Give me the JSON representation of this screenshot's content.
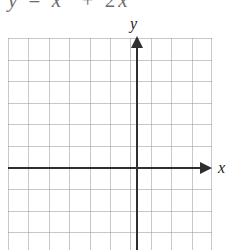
{
  "problem": {
    "equation_parts": {
      "lhs": "y",
      "equals": "=",
      "term1_base": "x",
      "term1_exp": "2",
      "plus": "+",
      "coefficient": "2",
      "term2": "x"
    },
    "equation_plain": "y = x2 + 2x"
  },
  "graph": {
    "x_axis_label": "x",
    "y_axis_label": "y",
    "colors": {
      "grid": "#969baa",
      "axis": "#2f2f2f",
      "background": "#ffffff"
    }
  },
  "chart_data": {
    "type": "line",
    "title": "",
    "xlabel": "x",
    "ylabel": "y",
    "grid": true,
    "legend": "none",
    "xlim": [
      -6,
      4
    ],
    "ylim": [
      -4,
      6
    ],
    "x_tick_step": 1,
    "y_tick_step": 1,
    "grid_columns": 10,
    "grid_rows": 10,
    "series": [
      {
        "name": "y = x2 + 2x",
        "x": [],
        "values": []
      }
    ],
    "annotations": [],
    "note": "Blank coordinate grid: axes drawn, no curve plotted."
  }
}
